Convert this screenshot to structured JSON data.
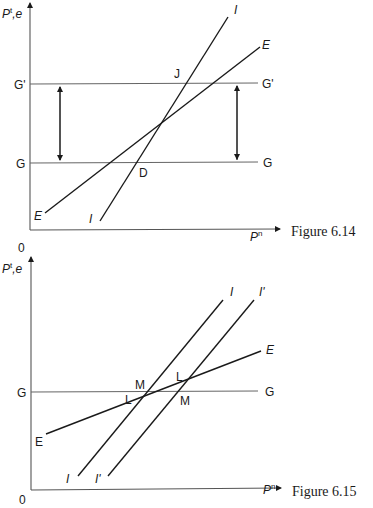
{
  "figures": [
    {
      "caption": "Figure 6.14",
      "y_axis_label": "Pᵗ,e",
      "y_axis_label_main": "P",
      "y_axis_label_sup": "t",
      "y_axis_label_rest": ",e",
      "x_axis_label_main": "P",
      "x_axis_label_sup": "n",
      "origin": "0",
      "hlines": [
        {
          "name": "G'",
          "left_label": "G'",
          "right_label": "G'"
        },
        {
          "name": "G",
          "left_label": "G",
          "right_label": "G"
        }
      ],
      "curves": [
        {
          "name": "I",
          "start_label": "I",
          "end_label": "I"
        },
        {
          "name": "E",
          "start_label": "E",
          "end_label": "E"
        }
      ],
      "points": [
        {
          "label": "J",
          "description": "I crosses G'"
        },
        {
          "label": "D",
          "description": "I crosses G"
        }
      ],
      "arrows": [
        "vertical double arrow between G and G' (left)",
        "vertical double arrow between G' and G (right)"
      ]
    },
    {
      "caption": "Figure 6.15",
      "y_axis_label_main": "P",
      "y_axis_label_sup": "t",
      "y_axis_label_rest": ",e",
      "x_axis_label_main": "P",
      "x_axis_label_sup": "n",
      "origin": "0",
      "hlines": [
        {
          "name": "G",
          "left_label": "G",
          "right_label": "G"
        }
      ],
      "curves": [
        {
          "name": "I",
          "start_label": "I",
          "end_label": "I"
        },
        {
          "name": "I'",
          "start_label": "I'",
          "end_label": "I'"
        },
        {
          "name": "E",
          "start_label": "E",
          "end_label": "E"
        }
      ],
      "points": [
        {
          "label": "M",
          "description": "I crosses G"
        },
        {
          "label": "L",
          "description": "I crosses E"
        },
        {
          "label": "L",
          "description": "I' crosses E"
        },
        {
          "label": "M",
          "description": "I' crosses G"
        }
      ]
    }
  ]
}
